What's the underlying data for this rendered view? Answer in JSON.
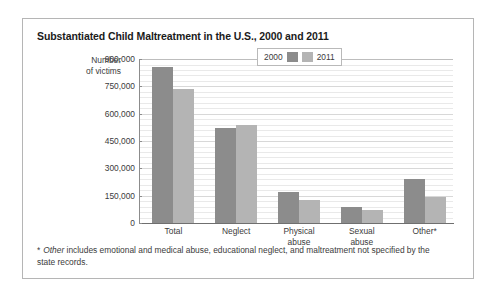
{
  "card": {
    "title": "Substantiated Child Maltreatment in the U.S., 2000 and 2011",
    "y_caption_line1": "Number",
    "y_caption_line2": "of victims",
    "footnote_marker": "*",
    "footnote_italic": "Other",
    "footnote_rest": " includes emotional and medical abuse, educational neglect, and maltreatment not specified by the state records."
  },
  "legend": {
    "items": [
      {
        "label": "2000",
        "color": "#8c8c8c"
      },
      {
        "label": "2011",
        "color": "#b4b4b4"
      }
    ]
  },
  "chart_data": {
    "type": "bar",
    "title": "Substantiated Child Maltreatment in the U.S., 2000 and 2011",
    "xlabel": "",
    "ylabel": "Number of victims",
    "categories": [
      "Total",
      "Neglect",
      "Physical abuse",
      "Sexual abuse",
      "Other*"
    ],
    "category_lines": [
      [
        "Total"
      ],
      [
        "Neglect"
      ],
      [
        "Physical",
        "abuse"
      ],
      [
        "Sexual",
        "abuse"
      ],
      [
        "Other*"
      ]
    ],
    "series": [
      {
        "name": "2000",
        "color": "#8c8c8c",
        "values": [
          856000,
          522000,
          170000,
          88000,
          242000
        ]
      },
      {
        "name": "2011",
        "color": "#b4b4b4",
        "values": [
          735000,
          538000,
          126000,
          71000,
          143000
        ]
      }
    ],
    "ylim": [
      0,
      900000
    ],
    "ytick_values": [
      0,
      150000,
      300000,
      450000,
      600000,
      750000,
      900000
    ],
    "ytick_labels": [
      "0",
      "150,000",
      "300,000",
      "450,000",
      "600,000",
      "750,000",
      "900,000"
    ],
    "minor_tick_step": 30000,
    "grid": true,
    "legend_position": "top-right"
  }
}
